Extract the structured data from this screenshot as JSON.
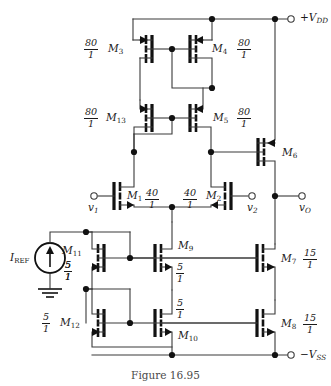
{
  "figure": {
    "caption": "Figure 16.95"
  },
  "rails": [
    {
      "name": "vdd",
      "label_prefix": "+V",
      "label_sub": "DD",
      "x": 290,
      "y": 19
    },
    {
      "name": "vss",
      "label_prefix": "−V",
      "label_sub": "SS",
      "x": 290,
      "y": 355
    }
  ],
  "ports": [
    {
      "name": "v1",
      "label_prefix": "v",
      "label_sub": "1",
      "x": 92,
      "y": 196
    },
    {
      "name": "v2",
      "label_prefix": "v",
      "label_sub": "2",
      "x": 254,
      "y": 196
    },
    {
      "name": "vo",
      "label_prefix": "v",
      "label_sub": "O",
      "x": 305,
      "y": 196
    }
  ],
  "source": {
    "name": "current-source",
    "label_prefix": "I",
    "label_sub": "REF",
    "ratio_num": "5",
    "ratio_den": "1",
    "cx": 50,
    "cy": 258
  },
  "transistors": [
    {
      "id": "M3",
      "label_prefix": "M",
      "label_sub": "3",
      "type": "pmos",
      "ratio_num": "80",
      "ratio_den": "1",
      "gx": 152,
      "gy": 49,
      "lx": 108,
      "ly": 43,
      "fx": 85,
      "fy": 38
    },
    {
      "id": "M4",
      "label_prefix": "M",
      "label_sub": "4",
      "type": "pmos",
      "ratio_num": "80",
      "ratio_den": "1",
      "gx": 190,
      "gy": 49,
      "lx": 215,
      "ly": 43,
      "fx": 238,
      "fy": 38
    },
    {
      "id": "M13",
      "label_prefix": "M",
      "label_sub": "13",
      "type": "pmos",
      "ratio_num": "80",
      "ratio_den": "1",
      "gx": 152,
      "gy": 118,
      "lx": 106,
      "ly": 112,
      "fx": 85,
      "fy": 107
    },
    {
      "id": "M5",
      "label_prefix": "M",
      "label_sub": "5",
      "type": "pmos",
      "ratio_num": "80",
      "ratio_den": "1",
      "gx": 190,
      "gy": 118,
      "lx": 215,
      "ly": 112,
      "fx": 238,
      "fy": 107
    },
    {
      "id": "M6",
      "label_prefix": "M",
      "label_sub": "6",
      "type": "pmos",
      "ratio_num": "",
      "ratio_den": "",
      "gx": 258,
      "gy": 152,
      "lx": 282,
      "ly": 147,
      "fx": 0,
      "fy": 0
    },
    {
      "id": "M1",
      "label_prefix": "M",
      "label_sub": "1",
      "type": "nmos",
      "ratio_num": "40",
      "ratio_den": "1",
      "gx": 114,
      "gy": 196,
      "lx": 126,
      "ly": 190,
      "fx": 146,
      "fy": 185
    },
    {
      "id": "M2",
      "label_prefix": "M",
      "label_sub": "2",
      "type": "nmos",
      "ratio_num": "40",
      "ratio_den": "1",
      "gx": 231,
      "gy": 196,
      "lx": 209,
      "ly": 190,
      "fx": 184,
      "fy": 185
    },
    {
      "id": "M11",
      "label_prefix": "M",
      "label_sub": "11",
      "type": "pmos",
      "ratio_num": "5",
      "ratio_den": "1",
      "gx": 104,
      "gy": 258,
      "lx": 68,
      "ly": 252,
      "fx": 65,
      "fy": 263
    },
    {
      "id": "M9",
      "label_prefix": "M",
      "label_sub": "9",
      "type": "nmos",
      "ratio_num": "5",
      "ratio_den": "1",
      "gx": 155,
      "gy": 258,
      "lx": 178,
      "ly": 243,
      "fx": 175,
      "fy": 262
    },
    {
      "id": "M7",
      "label_prefix": "M",
      "label_sub": "7",
      "type": "nmos",
      "ratio_num": "15",
      "ratio_den": "1",
      "gx": 257,
      "gy": 258,
      "lx": 283,
      "ly": 253,
      "fx": 305,
      "fy": 248
    },
    {
      "id": "M12",
      "label_prefix": "M",
      "label_sub": "12",
      "type": "pmos",
      "ratio_num": "5",
      "ratio_den": "1",
      "gx": 104,
      "gy": 323,
      "lx": 66,
      "ly": 317,
      "fx": 44,
      "fy": 312
    },
    {
      "id": "M10",
      "label_prefix": "M",
      "label_sub": "10",
      "type": "nmos",
      "ratio_num": "5",
      "ratio_den": "1",
      "gx": 155,
      "gy": 323,
      "lx": 178,
      "ly": 328,
      "fx": 175,
      "fy": 300
    },
    {
      "id": "M8",
      "label_prefix": "M",
      "label_sub": "8",
      "type": "nmos",
      "ratio_num": "15",
      "ratio_den": "1",
      "gx": 257,
      "gy": 323,
      "lx": 283,
      "ly": 318,
      "fx": 305,
      "fy": 313
    }
  ],
  "colors": {
    "wire": "#3a3a3a",
    "device": "#111111",
    "text": "#1a1a1a",
    "caption": "#4a4a4a",
    "background": "#ffffff"
  }
}
